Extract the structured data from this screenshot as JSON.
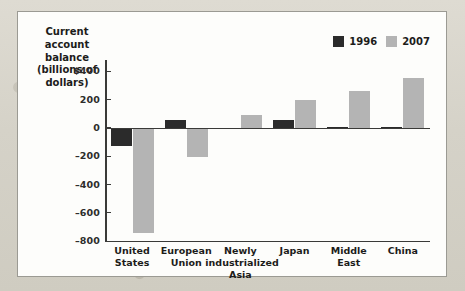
{
  "chart_data": {
    "type": "bar",
    "title": "Current account balance (billions of dollars)",
    "xlabel": "",
    "ylabel": "Current account balance (billions of dollars)",
    "ylim": [
      -800,
      400
    ],
    "yticks": [
      400,
      200,
      0,
      -200,
      -400,
      -600,
      -800
    ],
    "ytick_labels": [
      "$400",
      "200",
      "0",
      "–200",
      "–400",
      "–600",
      "–800"
    ],
    "grid": false,
    "legend_position": "top-right",
    "categories": [
      "United States",
      "European Union",
      "Newly industrialized Asia",
      "Japan",
      "Middle East",
      "China"
    ],
    "category_lines": [
      [
        "United",
        "States"
      ],
      [
        "European",
        "Union"
      ],
      [
        "Newly",
        "industrialized",
        "Asia"
      ],
      [
        "Japan"
      ],
      [
        "Middle",
        "East"
      ],
      [
        "China"
      ]
    ],
    "series": [
      {
        "name": "1996",
        "color": "#2b2b2b",
        "values": [
          -125,
          55,
          -3,
          58,
          10,
          7
        ]
      },
      {
        "name": "2007",
        "color": "#b4b4b4",
        "values": [
          -742,
          -205,
          90,
          200,
          262,
          350
        ]
      }
    ]
  },
  "legend": {
    "items": [
      {
        "label": "1996",
        "color": "#2b2b2b"
      },
      {
        "label": "2007",
        "color": "#b4b4b4"
      }
    ]
  },
  "colors": {
    "series_1996": "#2b2b2b",
    "series_2007": "#b4b4b4",
    "axis": "#3a3a38",
    "panel_background": "#fdfdfb",
    "panel_border": "#9b9a93",
    "page_background": "#d9d6cd"
  }
}
